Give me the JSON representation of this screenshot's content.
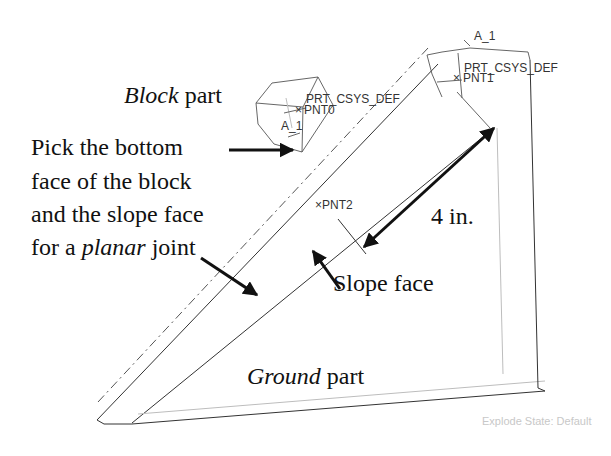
{
  "figure": {
    "labels": {
      "block_part_italic": "Block",
      "block_part_rest": " part",
      "instruction_lines": [
        "Pick the bottom",
        "face of the block",
        "and the slope face"
      ],
      "instruction_last_prefix": "for a ",
      "instruction_last_italic": "planar",
      "instruction_last_suffix": " joint",
      "dimension": "4 in.",
      "slope_face": "Slope face",
      "ground_part_italic": "Ground",
      "ground_part_rest": " part"
    },
    "cad_labels": {
      "block_csys": "PRT_CSYS_DEF",
      "block_point": "PNT0",
      "block_axis": "A_1",
      "ground_csys": "PRT_CSYS_DEF",
      "ground_point": "PNT1",
      "ground_axis": "A_1",
      "slope_point": "PNT2"
    },
    "status": {
      "explode_state": "Explode State: Default"
    },
    "colors": {
      "background": "#ffffff",
      "text": "#111111",
      "geometry": "#333333",
      "status_text": "#c8c8c8"
    }
  }
}
